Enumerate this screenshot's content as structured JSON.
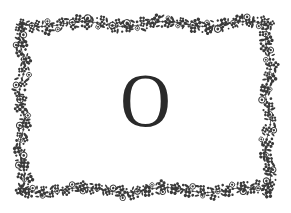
{
  "card": {
    "letter": "O",
    "background": "#ffffff",
    "ink_color": "#2a2a2a",
    "frame": {
      "style": "floral-vine-border",
      "color": "#3a3a3a",
      "left": 22,
      "top": 24,
      "right": 268,
      "bottom": 190
    }
  }
}
